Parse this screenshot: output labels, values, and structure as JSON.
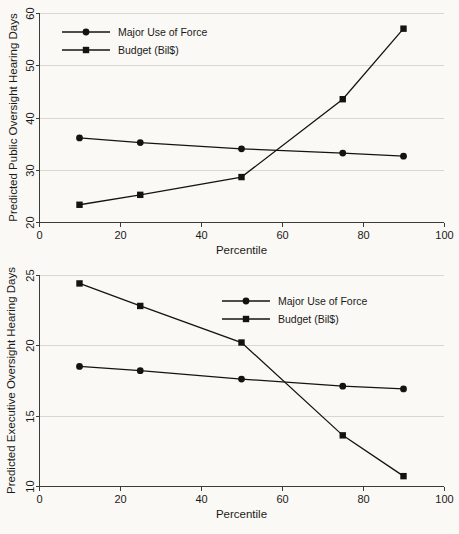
{
  "chart_data": [
    {
      "id": "public-oversight",
      "type": "line",
      "title": "",
      "xlabel": "Percentile",
      "ylabel": "Predicted Public Oversight Hearing Days",
      "x": [
        10,
        25,
        50,
        75,
        90
      ],
      "xtick_labels": [
        "0",
        "20",
        "40",
        "60",
        "80",
        "100"
      ],
      "xticks": [
        0,
        20,
        40,
        60,
        80,
        100
      ],
      "ytick_labels": [
        "20",
        "30",
        "40",
        "50",
        "60"
      ],
      "yticks": [
        20,
        30,
        40,
        50,
        60
      ],
      "xlim": [
        0,
        100
      ],
      "ylim": [
        20,
        60
      ],
      "grid": "horizontal",
      "legend_position": "top-left",
      "series": [
        {
          "name": "Major Use of Force",
          "marker": "circle",
          "values": [
            36.1,
            35.2,
            34.0,
            33.2,
            32.6
          ]
        },
        {
          "name": "Budget (Bil$)",
          "marker": "square",
          "values": [
            23.3,
            25.2,
            28.6,
            43.5,
            57.0
          ]
        }
      ]
    },
    {
      "id": "executive-oversight",
      "type": "line",
      "title": "",
      "xlabel": "Percentile",
      "ylabel": "Predicted Executive Oversight Hearing Days",
      "x": [
        10,
        25,
        50,
        75,
        90
      ],
      "xtick_labels": [
        "0",
        "20",
        "40",
        "60",
        "80",
        "100"
      ],
      "xticks": [
        0,
        20,
        40,
        60,
        80,
        100
      ],
      "ytick_labels": [
        "10",
        "15",
        "20",
        "25"
      ],
      "yticks": [
        10,
        15,
        20,
        25
      ],
      "xlim": [
        0,
        100
      ],
      "ylim": [
        10,
        25
      ],
      "grid": "horizontal",
      "legend_position": "top-right",
      "series": [
        {
          "name": "Major Use of Force",
          "marker": "circle",
          "values": [
            18.5,
            18.2,
            17.6,
            17.1,
            16.9
          ]
        },
        {
          "name": "Budget (Bil$)",
          "marker": "square",
          "values": [
            24.4,
            22.8,
            20.2,
            13.6,
            10.7
          ]
        }
      ]
    }
  ],
  "colors": {
    "background": "#faf9f5",
    "ink": "#14140f",
    "axis": "#3b3b38",
    "grid": "#d9d7cf"
  }
}
